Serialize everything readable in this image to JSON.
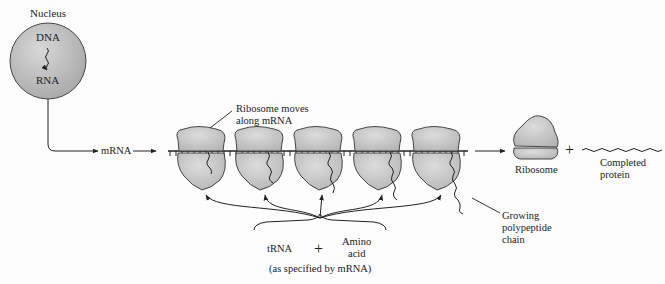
{
  "diagram": {
    "nucleus": {
      "label": "Nucleus",
      "dna_label": "DNA",
      "rna_label": "RNA"
    },
    "mrna_label": "mRNA",
    "ribosome_callout": "Ribosome moves along mRNA",
    "ribosome_callout_lines": [
      "Ribosome moves",
      "along mRNA"
    ],
    "ribosome_count_on_mrna": 5,
    "free_ribosome_label": "Ribosome",
    "plus_symbol": "+",
    "completed_protein_lines": [
      "Completed",
      "protein"
    ],
    "polypeptide_lines": [
      "Growing",
      "polypeptide",
      "chain"
    ],
    "inputs": {
      "trna_label": "tRNA",
      "plus_symbol": "+",
      "amino_acid_lines": [
        "Amino",
        "acid"
      ],
      "note": "(as specified by mRNA)"
    },
    "colors": {
      "nucleus_fill": "#b8b8b8",
      "ribosome_fill": "#c4c4c4",
      "stroke": "#333333",
      "background": "#fdfdfd"
    }
  }
}
